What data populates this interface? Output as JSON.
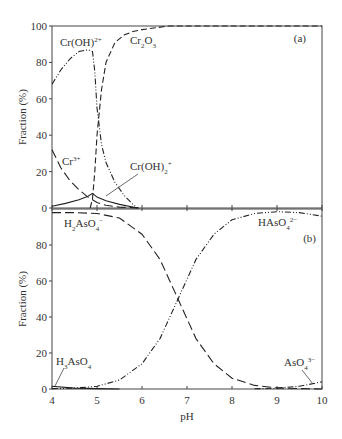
{
  "chart_data": [
    {
      "panel": "(a)",
      "type": "line",
      "title": "",
      "xlabel": "pH",
      "ylabel": "Fraction (%)",
      "xlim": [
        4,
        10
      ],
      "ylim": [
        0,
        100
      ],
      "yticks": [
        0,
        20,
        40,
        60,
        80,
        100
      ],
      "xticks": [
        4,
        5,
        6,
        7,
        8,
        9,
        10
      ],
      "grid": false,
      "series": [
        {
          "name": "Cr(OH)2+",
          "label_html": "Cr(OH)<sup>2+</sup>",
          "style": "dash-dot-dot",
          "x": [
            4.0,
            4.2,
            4.4,
            4.6,
            4.8,
            4.9,
            4.95,
            5.0,
            5.1,
            5.2,
            5.4,
            5.6,
            5.8,
            5.9
          ],
          "y": [
            68,
            76,
            82,
            86,
            87,
            86,
            75,
            55,
            35,
            25,
            14,
            7,
            2,
            0
          ]
        },
        {
          "name": "Cr2O3",
          "label_html": "Cr<sub>2</sub>O<sub>3</sub>",
          "style": "dashed",
          "x": [
            4.85,
            4.9,
            4.95,
            5.0,
            5.1,
            5.2,
            5.4,
            5.6,
            5.8,
            6.0,
            6.3,
            6.6,
            7.0,
            10.0
          ],
          "y": [
            0,
            5,
            20,
            40,
            65,
            80,
            91,
            95,
            97,
            98,
            99,
            100,
            100,
            100
          ]
        },
        {
          "name": "Cr3+",
          "label_html": "Cr<sup>3+</sup>",
          "style": "long-dash",
          "x": [
            4.0,
            4.2,
            4.4,
            4.6,
            4.8,
            5.0,
            5.2,
            5.5,
            5.8,
            6.0
          ],
          "y": [
            32,
            22,
            15,
            10,
            6,
            3,
            1.5,
            0.5,
            0.2,
            0
          ]
        },
        {
          "name": "Cr(OH)2+_2",
          "label_html": "Cr(OH)<sub>2</sub><sup>+</sup>",
          "style": "solid",
          "x": [
            4.0,
            4.3,
            4.6,
            4.8,
            4.9,
            5.0,
            5.2,
            5.5,
            5.9
          ],
          "y": [
            1,
            2.5,
            4.5,
            6.5,
            8,
            6,
            4,
            2,
            0
          ]
        }
      ],
      "annotations": [
        "(a)"
      ]
    },
    {
      "panel": "(b)",
      "type": "line",
      "title": "",
      "xlabel": "pH",
      "ylabel": "Fraction (%)",
      "xlim": [
        4,
        10
      ],
      "ylim": [
        0,
        100
      ],
      "yticks": [
        0,
        20,
        40,
        60,
        80
      ],
      "xticks": [
        4,
        5,
        6,
        7,
        8,
        9,
        10
      ],
      "grid": false,
      "series": [
        {
          "name": "H3AsO4",
          "label_html": "H<sub>3</sub>AsO<sub>4</sub>",
          "style": "solid",
          "x": [
            4.0,
            4.5,
            5.0,
            5.5
          ],
          "y": [
            1.5,
            0.5,
            0.2,
            0
          ]
        },
        {
          "name": "H2AsO4-",
          "label_html": "H<sub>2</sub>AsO<sub>4</sub><sup>−</sup>",
          "style": "long-dash",
          "x": [
            4.0,
            4.5,
            5.0,
            5.5,
            6.0,
            6.4,
            6.8,
            7.2,
            7.6,
            8.0,
            8.5,
            9.0,
            9.5,
            10.0
          ],
          "y": [
            98,
            98,
            97.5,
            95,
            86,
            72,
            50,
            28,
            14,
            6,
            2,
            0.6,
            0.2,
            0
          ]
        },
        {
          "name": "HAsO4 2-",
          "label_html": "HAsO<sub>4</sub><sup>2−</sup>",
          "style": "dash-dot-dot",
          "x": [
            4.0,
            4.5,
            5.0,
            5.5,
            6.0,
            6.4,
            6.8,
            7.2,
            7.6,
            8.0,
            8.5,
            9.0,
            9.5,
            10.0
          ],
          "y": [
            0.2,
            0.5,
            1.5,
            5,
            14,
            28,
            50,
            72,
            86,
            94,
            97.5,
            98.5,
            98,
            96
          ]
        },
        {
          "name": "AsO4 3-",
          "label_html": "AsO<sub>4</sub><sup>3−</sup>",
          "style": "dash-dot",
          "x": [
            8.5,
            9.0,
            9.5,
            10.0
          ],
          "y": [
            0.1,
            0.5,
            1.5,
            4
          ]
        }
      ],
      "annotations": [
        "(b)"
      ]
    }
  ],
  "labels": {
    "ylabel": "Fraction (%)",
    "xlabel": "pH",
    "panel_a": "(a)",
    "panel_b": "(b)",
    "ytick_labels_top": [
      "100",
      "80",
      "60",
      "40",
      "20",
      "0"
    ],
    "ytick_labels_bottom": [
      "80",
      "60",
      "40",
      "20",
      "0"
    ],
    "xtick_labels": [
      "4",
      "5",
      "6",
      "7",
      "8",
      "9",
      "10"
    ]
  }
}
